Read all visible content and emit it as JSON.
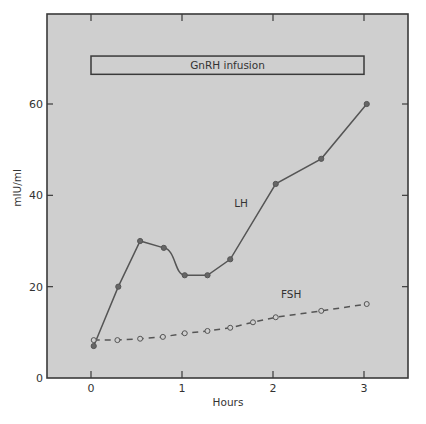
{
  "chart_data": {
    "type": "line",
    "title": "",
    "xlabel": "Hours",
    "ylabel": "mIU/ml",
    "xlim": [
      -0.5,
      3.45
    ],
    "ylim": [
      0,
      71
    ],
    "xticks": [
      0,
      1,
      2,
      3
    ],
    "yticks": [
      0,
      20,
      40,
      60
    ],
    "grid": false,
    "legend": "inline labels",
    "annotations": [
      {
        "type": "bar",
        "text": "GnRH infusion",
        "x_start": 0,
        "x_end": 3,
        "y_low": 66.5,
        "y_high": 70.5
      }
    ],
    "series": [
      {
        "name": "LH",
        "style": "solid",
        "marker": "filled-circle",
        "x": [
          0.03,
          0.3,
          0.54,
          0.8,
          1.03,
          1.28,
          1.53,
          2.03,
          2.53,
          3.03
        ],
        "values": [
          7,
          20,
          30,
          28.5,
          22.5,
          22.5,
          26,
          42.5,
          48,
          60
        ],
        "label_pos": [
          1.65,
          37.5
        ]
      },
      {
        "name": "FSH",
        "style": "dashed",
        "marker": "open-circle",
        "x": [
          0.03,
          0.29,
          0.54,
          0.79,
          1.03,
          1.28,
          1.53,
          1.78,
          2.03,
          2.53,
          3.03
        ],
        "values": [
          8.3,
          8.3,
          8.6,
          9.0,
          9.8,
          10.3,
          11.0,
          12.2,
          13.3,
          14.7,
          16.2
        ],
        "label_pos": [
          2.2,
          17.5
        ]
      }
    ]
  },
  "colors": {
    "plot_bg": "#cfcfcf",
    "axis": "#3a3a3a",
    "line": "#555555",
    "text": "#333333"
  }
}
